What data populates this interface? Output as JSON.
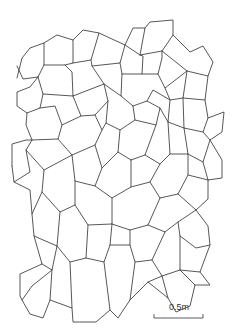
{
  "diagram": {
    "title": "",
    "stroke_color": "#444444",
    "background": "#ffffff",
    "polylines": [
      [
        [
          17,
          78
        ],
        [
          22,
          58
        ],
        [
          30,
          48
        ],
        [
          44,
          43
        ],
        [
          44,
          65
        ],
        [
          38,
          77
        ],
        [
          23,
          79
        ],
        [
          17,
          66
        ]
      ],
      [
        [
          44,
          43
        ],
        [
          57,
          35
        ],
        [
          73,
          40
        ],
        [
          73,
          63
        ],
        [
          65,
          65
        ],
        [
          44,
          65
        ]
      ],
      [
        [
          73,
          40
        ],
        [
          83,
          30
        ],
        [
          99,
          33
        ],
        [
          91,
          60
        ],
        [
          73,
          63
        ]
      ],
      [
        [
          99,
          33
        ],
        [
          125,
          45
        ],
        [
          120,
          63
        ],
        [
          92,
          66
        ],
        [
          91,
          60
        ]
      ],
      [
        [
          125,
          45
        ],
        [
          133,
          28
        ],
        [
          145,
          28
        ],
        [
          140,
          55
        ],
        [
          125,
          45
        ]
      ],
      [
        [
          145,
          28
        ],
        [
          150,
          22
        ],
        [
          173,
          20
        ],
        [
          173,
          35
        ],
        [
          162,
          51
        ],
        [
          140,
          55
        ]
      ],
      [
        [
          173,
          35
        ],
        [
          190,
          52
        ],
        [
          203,
          46
        ],
        [
          213,
          62
        ],
        [
          208,
          76
        ],
        [
          187,
          71
        ],
        [
          162,
          51
        ]
      ],
      [
        [
          38,
          77
        ],
        [
          30,
          87
        ],
        [
          17,
          92
        ],
        [
          17,
          106
        ],
        [
          27,
          113
        ],
        [
          40,
          108
        ],
        [
          43,
          94
        ],
        [
          38,
          77
        ]
      ],
      [
        [
          65,
          65
        ],
        [
          72,
          72
        ],
        [
          73,
          96
        ],
        [
          43,
          94
        ]
      ],
      [
        [
          92,
          66
        ],
        [
          104,
          84
        ],
        [
          73,
          96
        ]
      ],
      [
        [
          120,
          63
        ],
        [
          122,
          74
        ],
        [
          142,
          74
        ],
        [
          143,
          56
        ],
        [
          140,
          55
        ]
      ],
      [
        [
          122,
          74
        ],
        [
          121,
          96
        ],
        [
          104,
          84
        ]
      ],
      [
        [
          142,
          74
        ],
        [
          158,
          74
        ],
        [
          162,
          58
        ],
        [
          162,
          51
        ]
      ],
      [
        [
          158,
          74
        ],
        [
          165,
          88
        ],
        [
          187,
          71
        ]
      ],
      [
        [
          187,
          71
        ],
        [
          183,
          98
        ],
        [
          170,
          100
        ],
        [
          165,
          88
        ]
      ],
      [
        [
          208,
          76
        ],
        [
          205,
          100
        ],
        [
          183,
          98
        ]
      ],
      [
        [
          205,
          100
        ],
        [
          208,
          118
        ],
        [
          203,
          132
        ],
        [
          210,
          140
        ],
        [
          222,
          132
        ],
        [
          224,
          112
        ],
        [
          208,
          118
        ]
      ],
      [
        [
          27,
          113
        ],
        [
          26,
          125
        ],
        [
          32,
          140
        ],
        [
          26,
          150
        ],
        [
          30,
          172
        ],
        [
          14,
          182
        ],
        [
          12,
          166
        ]
      ],
      [
        [
          12,
          166
        ],
        [
          12,
          144
        ],
        [
          26,
          140
        ],
        [
          32,
          140
        ]
      ],
      [
        [
          40,
          108
        ],
        [
          55,
          106
        ],
        [
          62,
          125
        ],
        [
          58,
          139
        ],
        [
          32,
          140
        ]
      ],
      [
        [
          73,
          96
        ],
        [
          81,
          116
        ],
        [
          62,
          125
        ]
      ],
      [
        [
          104,
          84
        ],
        [
          108,
          101
        ],
        [
          95,
          115
        ],
        [
          81,
          116
        ]
      ],
      [
        [
          121,
          96
        ],
        [
          133,
          106
        ],
        [
          135,
          120
        ],
        [
          120,
          130
        ],
        [
          106,
          123
        ],
        [
          108,
          101
        ]
      ],
      [
        [
          133,
          106
        ],
        [
          147,
          101
        ],
        [
          160,
          108
        ],
        [
          156,
          125
        ],
        [
          135,
          120
        ]
      ],
      [
        [
          147,
          101
        ],
        [
          153,
          90
        ],
        [
          170,
          100
        ],
        [
          168,
          122
        ],
        [
          160,
          108
        ]
      ],
      [
        [
          168,
          122
        ],
        [
          184,
          128
        ],
        [
          203,
          132
        ]
      ],
      [
        [
          183,
          98
        ],
        [
          184,
          128
        ]
      ],
      [
        [
          58,
          139
        ],
        [
          72,
          155
        ],
        [
          95,
          145
        ],
        [
          102,
          130
        ],
        [
          95,
          115
        ]
      ],
      [
        [
          102,
          130
        ],
        [
          106,
          123
        ]
      ],
      [
        [
          120,
          130
        ],
        [
          118,
          152
        ],
        [
          131,
          160
        ]
      ],
      [
        [
          131,
          160
        ],
        [
          145,
          155
        ],
        [
          156,
          125
        ]
      ],
      [
        [
          145,
          155
        ],
        [
          160,
          164
        ],
        [
          170,
          154
        ],
        [
          168,
          122
        ]
      ],
      [
        [
          170,
          154
        ],
        [
          188,
          154
        ],
        [
          184,
          128
        ]
      ],
      [
        [
          188,
          154
        ],
        [
          203,
          162
        ],
        [
          210,
          140
        ]
      ],
      [
        [
          203,
          162
        ],
        [
          208,
          180
        ],
        [
          222,
          178
        ],
        [
          222,
          160
        ],
        [
          210,
          140
        ]
      ],
      [
        [
          26,
          150
        ],
        [
          44,
          170
        ],
        [
          42,
          192
        ],
        [
          32,
          214
        ],
        [
          30,
          190
        ],
        [
          14,
          182
        ]
      ],
      [
        [
          44,
          170
        ],
        [
          72,
          155
        ]
      ],
      [
        [
          72,
          155
        ],
        [
          75,
          181
        ],
        [
          95,
          186
        ],
        [
          102,
          168
        ],
        [
          95,
          145
        ]
      ],
      [
        [
          102,
          168
        ],
        [
          118,
          152
        ]
      ],
      [
        [
          95,
          186
        ],
        [
          112,
          198
        ],
        [
          131,
          187
        ],
        [
          131,
          160
        ]
      ],
      [
        [
          131,
          187
        ],
        [
          150,
          182
        ],
        [
          160,
          164
        ]
      ],
      [
        [
          150,
          182
        ],
        [
          160,
          198
        ],
        [
          178,
          194
        ],
        [
          188,
          175
        ],
        [
          188,
          154
        ]
      ],
      [
        [
          188,
          175
        ],
        [
          208,
          180
        ]
      ],
      [
        [
          178,
          194
        ],
        [
          196,
          210
        ],
        [
          208,
          199
        ],
        [
          208,
          180
        ]
      ],
      [
        [
          42,
          192
        ],
        [
          60,
          212
        ],
        [
          75,
          205
        ],
        [
          75,
          181
        ]
      ],
      [
        [
          75,
          205
        ],
        [
          88,
          225
        ],
        [
          112,
          224
        ],
        [
          112,
          198
        ]
      ],
      [
        [
          112,
          224
        ],
        [
          130,
          230
        ],
        [
          148,
          225
        ],
        [
          160,
          198
        ]
      ],
      [
        [
          148,
          225
        ],
        [
          165,
          232
        ],
        [
          178,
          222
        ],
        [
          196,
          210
        ]
      ],
      [
        [
          178,
          222
        ],
        [
          180,
          236
        ],
        [
          196,
          248
        ],
        [
          210,
          245
        ],
        [
          208,
          226
        ],
        [
          196,
          210
        ]
      ],
      [
        [
          32,
          214
        ],
        [
          34,
          236
        ],
        [
          57,
          246
        ],
        [
          60,
          212
        ]
      ],
      [
        [
          57,
          246
        ],
        [
          70,
          262
        ],
        [
          86,
          258
        ],
        [
          88,
          225
        ]
      ],
      [
        [
          86,
          258
        ],
        [
          104,
          262
        ],
        [
          110,
          245
        ],
        [
          112,
          224
        ]
      ],
      [
        [
          110,
          245
        ],
        [
          130,
          245
        ],
        [
          130,
          230
        ]
      ],
      [
        [
          130,
          245
        ],
        [
          135,
          262
        ],
        [
          152,
          260
        ],
        [
          165,
          232
        ]
      ],
      [
        [
          152,
          260
        ],
        [
          162,
          276
        ],
        [
          180,
          270
        ],
        [
          180,
          236
        ]
      ],
      [
        [
          180,
          270
        ],
        [
          200,
          272
        ],
        [
          210,
          245
        ]
      ],
      [
        [
          34,
          236
        ],
        [
          42,
          264
        ],
        [
          52,
          270
        ],
        [
          57,
          246
        ]
      ],
      [
        [
          52,
          270
        ],
        [
          32,
          286
        ],
        [
          22,
          300
        ],
        [
          30,
          314
        ],
        [
          43,
          318
        ],
        [
          50,
          300
        ],
        [
          52,
          270
        ]
      ],
      [
        [
          42,
          264
        ],
        [
          20,
          274
        ],
        [
          20,
          296
        ],
        [
          22,
          300
        ]
      ],
      [
        [
          50,
          300
        ],
        [
          72,
          308
        ],
        [
          70,
          262
        ]
      ],
      [
        [
          72,
          308
        ],
        [
          73,
          322
        ],
        [
          96,
          322
        ],
        [
          110,
          310
        ],
        [
          104,
          262
        ]
      ],
      [
        [
          110,
          310
        ],
        [
          118,
          318
        ],
        [
          130,
          300
        ],
        [
          135,
          262
        ]
      ],
      [
        [
          130,
          300
        ],
        [
          148,
          282
        ],
        [
          162,
          276
        ]
      ],
      [
        [
          148,
          282
        ],
        [
          168,
          298
        ],
        [
          162,
          276
        ]
      ],
      [
        [
          168,
          298
        ],
        [
          176,
          312
        ],
        [
          190,
          306
        ],
        [
          195,
          285
        ],
        [
          180,
          270
        ]
      ],
      [
        [
          195,
          285
        ],
        [
          210,
          285
        ],
        [
          200,
          272
        ]
      ]
    ],
    "scale_bar": {
      "label": "0.5m",
      "x1": 154,
      "x2": 203,
      "y": 318,
      "tick_height": 4
    }
  }
}
